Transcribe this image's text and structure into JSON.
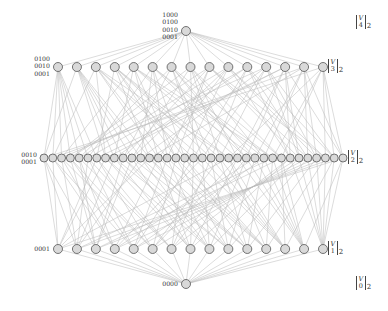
{
  "diagram": {
    "edge_color": "#b8b8b8",
    "node_fill": "#d9d9d9",
    "node_stroke": "#555555",
    "levels": [
      {
        "dim": 4,
        "count": 1,
        "y": 31,
        "x_start": 186,
        "x_end": 186,
        "r": 4.5,
        "label": "1000\n0100\n0010\n0001",
        "label_x": 178,
        "label_y": 11,
        "rank_top": "V",
        "rank_bottom": "4",
        "rank_sub": "2",
        "rank_x": 356,
        "rank_y": 14
      },
      {
        "dim": 3,
        "count": 15,
        "y": 67,
        "x_start": 58,
        "x_end": 323,
        "r": 4.5,
        "label": "0100\n0010\n0001",
        "label_x": 50,
        "label_y": 55,
        "rank_top": "V",
        "rank_bottom": "3",
        "rank_sub": "2",
        "rank_x": 328,
        "rank_y": 58
      },
      {
        "dim": 2,
        "count": 35,
        "y": 158,
        "x_start": 44,
        "x_end": 343,
        "r": 4.0,
        "label": "0010\n0001",
        "label_x": 37,
        "label_y": 151,
        "rank_top": "V",
        "rank_bottom": "2",
        "rank_sub": "2",
        "rank_x": 348,
        "rank_y": 149
      },
      {
        "dim": 1,
        "count": 15,
        "y": 249,
        "x_start": 58,
        "x_end": 323,
        "r": 4.5,
        "label": "0001",
        "label_x": 50,
        "label_y": 245,
        "rank_top": "V",
        "rank_bottom": "1",
        "rank_sub": "2",
        "rank_x": 328,
        "rank_y": 240
      },
      {
        "dim": 0,
        "count": 1,
        "y": 284,
        "x_start": 186,
        "x_end": 186,
        "r": 4.5,
        "label": "0000",
        "label_x": 178,
        "label_y": 280,
        "rank_top": "V",
        "rank_bottom": "0",
        "rank_sub": "2",
        "rank_x": 356,
        "rank_y": 275
      }
    ]
  }
}
